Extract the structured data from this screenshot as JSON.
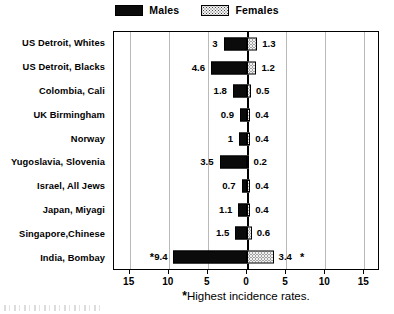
{
  "legend": {
    "entries": [
      {
        "label": "Males",
        "swatch": "solid-black-swatch"
      },
      {
        "label": "Females",
        "swatch": "stippled-swatch"
      }
    ]
  },
  "footnote": {
    "marker": "*",
    "text": "Highest incidence rates."
  },
  "chart_data": {
    "type": "bar",
    "orientation": "horizontal-diverging",
    "title": "",
    "subtitle": "",
    "xlabel": "",
    "ylabel": "",
    "grid": true,
    "legend_position": "top-center",
    "xlim": [
      -17,
      17
    ],
    "xticks": [
      15,
      10,
      5,
      0,
      5,
      10,
      15
    ],
    "xtick_values": [
      -15,
      -10,
      -5,
      0,
      5,
      10,
      15
    ],
    "categories": [
      "US Detroit, Whites",
      "US Detroit, Blacks",
      "Colombia, Cali",
      "UK Birmingham",
      "Norway",
      "Yugoslavia, Slovenia",
      "Israel, All Jews",
      "Japan, Miyagi",
      "Singapore,Chinese",
      "India, Bombay"
    ],
    "series": [
      {
        "name": "Males",
        "direction": "left",
        "values": [
          3,
          4.6,
          1.8,
          0.9,
          1,
          3.5,
          0.7,
          1.1,
          1.5,
          9.4
        ],
        "labels": [
          "3",
          "4.6",
          "1.8",
          "0.9",
          "1",
          "3.5",
          "0.7",
          "1.1",
          "1.5",
          "9.4"
        ]
      },
      {
        "name": "Females",
        "direction": "right",
        "values": [
          1.3,
          1.2,
          0.5,
          0.4,
          0.4,
          0.2,
          0.4,
          0.4,
          0.6,
          3.4
        ],
        "labels": [
          "1.3",
          "1.2",
          "0.5",
          "0.4",
          "0.4",
          "0.2",
          "0.4",
          "0.4",
          "0.6",
          "3.4"
        ]
      }
    ],
    "annotations": [
      {
        "category": "India, Bombay",
        "series": "Males",
        "marker": "*"
      },
      {
        "category": "India, Bombay",
        "series": "Females",
        "marker": "*"
      }
    ],
    "colors": {
      "males": "#0b0b0b",
      "females": "#efefef",
      "axis": "#000000",
      "grid": "#b9b9b9",
      "background": "#ffffff"
    }
  }
}
